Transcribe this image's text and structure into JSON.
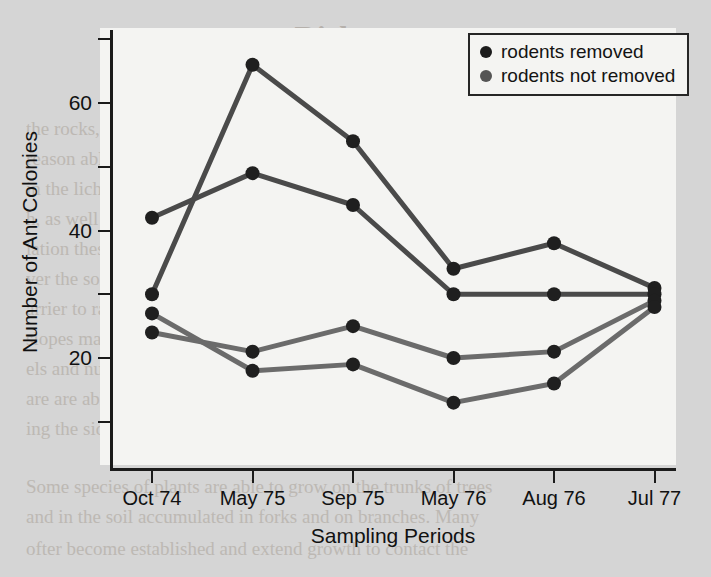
{
  "figure": {
    "background_color": "#f4f4f2",
    "page_background_color": "#d5d5d5"
  },
  "axes": {
    "y_axis_title": "Number of Ant Colonies",
    "x_axis_title": "Sampling Periods",
    "y_tick_labels": [
      "20",
      "40",
      "60"
    ],
    "y_tick_values": [
      20,
      40,
      60
    ],
    "y_minor_tick_values": [
      10,
      30,
      50,
      70
    ],
    "x_tick_labels": [
      "Oct 74",
      "May 75",
      "Sep 75",
      "May 76",
      "Aug 76",
      "Jul 77"
    ]
  },
  "legend": {
    "position": "top-right",
    "items": [
      {
        "label": "rodents removed",
        "color": "#1c1c1c",
        "marker": "filled-circle"
      },
      {
        "label": "rodents not removed",
        "color": "#555555",
        "marker": "filled-circle"
      }
    ]
  },
  "chart_data": {
    "type": "line",
    "title": "",
    "subtitle": "",
    "xlabel": "Sampling Periods",
    "ylabel": "Number of Ant Colonies",
    "categories": [
      "Oct 74",
      "May 75",
      "Sep 75",
      "May 76",
      "Aug 76",
      "Jul 77"
    ],
    "ylim": [
      0,
      72
    ],
    "xlim": [
      0,
      5
    ],
    "grid": false,
    "legend_position": "top-right",
    "series": [
      {
        "name": "rodents removed (A)",
        "group": "rodents removed",
        "color": "#4a4a4a",
        "marker": "filled-circle",
        "values": [
          30,
          66,
          54,
          34,
          38,
          31
        ]
      },
      {
        "name": "rodents removed (B)",
        "group": "rodents removed",
        "color": "#4a4a4a",
        "marker": "filled-circle",
        "values": [
          42,
          49,
          44,
          30,
          30,
          30
        ]
      },
      {
        "name": "rodents not removed (A)",
        "group": "rodents not removed",
        "color": "#6b6b6b",
        "marker": "filled-circle",
        "values": [
          24,
          21,
          25,
          20,
          21,
          29
        ]
      },
      {
        "name": "rodents not removed (B)",
        "group": "rodents not removed",
        "color": "#6b6b6b",
        "marker": "filled-circle",
        "values": [
          27,
          18,
          19,
          13,
          16,
          28
        ]
      }
    ]
  },
  "background_text": {
    "title": "verse Richness",
    "lines": [
      "the rocks, and infrequent avalanche flaws. Lichens persist on",
      "reason able to grow under such conditions, while lichens are",
      "in the lichens help break down the substrate, and nutrients",
      "h, as well as adding to the accumulation of soil.",
      "iation these mosses become eventually building up to a",
      "ver the soil for shade/serves to hold moisture and nutrients",
      "arrier to rain, since water reaches more than in the open",
      "slopes may not develop in cracks in a rock surface, while",
      "els and nutrients may gather in the rocks soil. More nutrients",
      "are are able to become established, and this eventually grow",
      "ing the side extent form a dense grassy forest.",
      "Some species of plants are able to grow on the trunks of trees",
      "and in the soil accumulated in forks and on branches. Many",
      "ofter become established and extend growth to contact the"
    ]
  }
}
